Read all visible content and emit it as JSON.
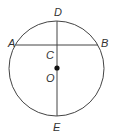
{
  "diagram": {
    "type": "circle-geometry",
    "stroke_color": "#444444",
    "circle": {
      "center_label": "O",
      "cx": 56.5,
      "cy": 68.5,
      "r": 47.5
    },
    "points": {
      "A": {
        "label": "A",
        "x": 17,
        "y": 45
      },
      "B": {
        "label": "B",
        "x": 97,
        "y": 45
      },
      "C": {
        "label": "C",
        "x": 57,
        "y": 45
      },
      "D": {
        "label": "D",
        "x": 57,
        "y": 21
      },
      "E": {
        "label": "E",
        "x": 57,
        "y": 116
      },
      "O": {
        "label": "O",
        "x": 57,
        "y": 68
      }
    },
    "segments": [
      {
        "name": "chord-AB",
        "from": "A",
        "to": "B"
      },
      {
        "name": "diameter-DE",
        "from": "D",
        "to": "E"
      }
    ]
  }
}
